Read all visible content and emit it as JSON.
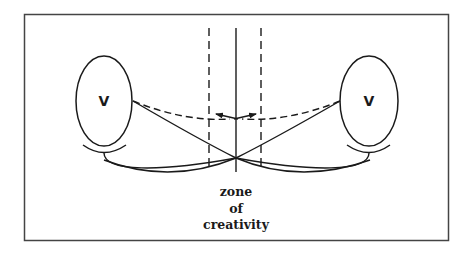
{
  "diagram": {
    "left_node": {
      "label": "V"
    },
    "right_node": {
      "label": "V"
    },
    "zone_label": {
      "line1": "zone",
      "line2": "of",
      "line3": "creativity"
    }
  },
  "colors": {
    "stroke": "#1a1a1a",
    "frame": "#444444",
    "background": "#ffffff"
  }
}
